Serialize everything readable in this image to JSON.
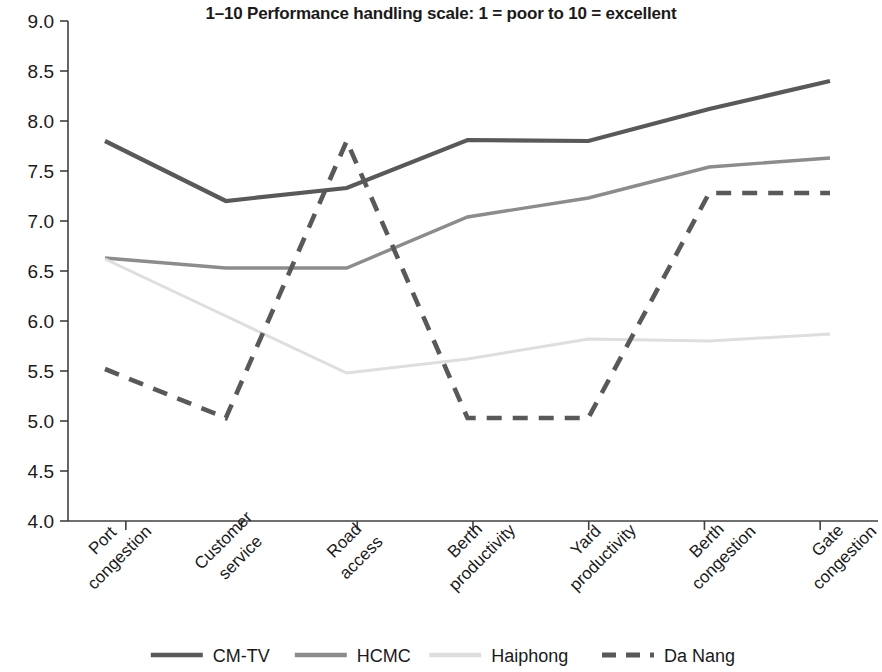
{
  "chart_data": {
    "type": "line",
    "title": "1–10 Performance handling scale: 1 = poor to 10 = excellent",
    "xlabel": "",
    "ylabel": "",
    "ylim": [
      4.0,
      9.0
    ],
    "ytick_step": 0.5,
    "grid": false,
    "legend_position": "bottom",
    "categories": [
      "Port congestion",
      "Customer service",
      "Road access",
      "Berth productivity",
      "Yard productivity",
      "Berth congestion",
      "Gate congestion"
    ],
    "ytick_labels": [
      "4.0",
      "4.5",
      "5.0",
      "5.5",
      "6.0",
      "6.5",
      "7.0",
      "7.5",
      "8.0",
      "8.5",
      "9.0"
    ],
    "series": [
      {
        "name": "CM-TV",
        "color": "#595959",
        "style": "solid",
        "width": 4.2,
        "values": [
          7.8,
          7.2,
          7.33,
          7.81,
          7.8,
          8.12,
          8.4
        ]
      },
      {
        "name": "HCMC",
        "color": "#8c8c8c",
        "style": "solid",
        "width": 3.4,
        "values": [
          6.63,
          6.53,
          6.53,
          7.04,
          7.23,
          7.54,
          7.63
        ]
      },
      {
        "name": "Haiphong",
        "color": "#dedede",
        "style": "solid",
        "width": 3.0,
        "values": [
          6.62,
          6.05,
          5.48,
          5.62,
          5.82,
          5.8,
          5.87
        ]
      },
      {
        "name": "Da Nang",
        "color": "#595959",
        "style": "dashed",
        "width": 4.6,
        "values": [
          5.52,
          5.03,
          7.8,
          5.03,
          5.03,
          7.28,
          7.28
        ]
      }
    ]
  },
  "legend": {
    "items": [
      {
        "label": "CM-TV",
        "color": "#595959",
        "style": "solid"
      },
      {
        "label": "HCMC",
        "color": "#8c8c8c",
        "style": "solid"
      },
      {
        "label": "Haiphong",
        "color": "#dedede",
        "style": "solid"
      },
      {
        "label": "Da Nang",
        "color": "#595959",
        "style": "dashed"
      }
    ]
  }
}
